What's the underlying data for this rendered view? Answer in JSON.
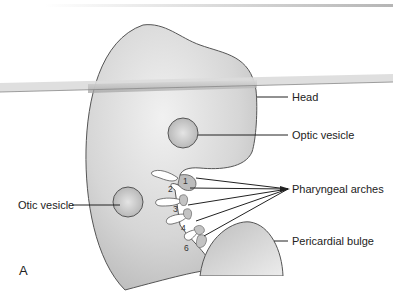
{
  "figure": {
    "panel_label": "A",
    "labels": {
      "head": "Head",
      "optic_vesicle": "Optic vesicle",
      "otic_vesicle": "Otic vesicle",
      "pharyngeal_arches": "Pharyngeal arches",
      "pericardial_bulge": "Pericardial bulge"
    },
    "arch_numbers": [
      "1",
      "2",
      "3",
      "4",
      "6"
    ],
    "colors": {
      "body_fill": "#c8c8c8",
      "body_highlight": "#ececec",
      "outline": "#555555",
      "band": "#a9a9a9",
      "leader": "#222222"
    }
  }
}
